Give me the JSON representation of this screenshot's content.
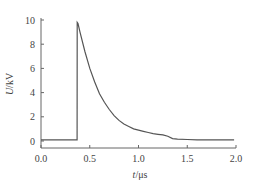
{
  "chart_data": {
    "type": "line",
    "title": "",
    "xlabel": "t/μs",
    "ylabel": "U/kV",
    "xlabel_italic_part": "t",
    "xlabel_unit": "/μs",
    "ylabel_italic_part": "U",
    "ylabel_unit": "/kV",
    "xlim": [
      0.0,
      2.0
    ],
    "ylim": [
      0,
      10
    ],
    "xticks": [
      "0.0",
      "0.5",
      "1.0",
      "1.5",
      "2.0"
    ],
    "yticks": [
      "0",
      "2",
      "4",
      "6",
      "8",
      "10"
    ],
    "grid": false,
    "legend": null,
    "line_color": "#555555",
    "series": [
      {
        "name": "voltage pulse",
        "x": [
          0.0,
          0.05,
          0.1,
          0.15,
          0.2,
          0.25,
          0.3,
          0.35,
          0.37,
          0.371,
          0.38,
          0.4,
          0.45,
          0.5,
          0.55,
          0.6,
          0.65,
          0.7,
          0.75,
          0.8,
          0.85,
          0.9,
          0.95,
          1.0,
          1.05,
          1.1,
          1.15,
          1.2,
          1.25,
          1.3,
          1.35,
          1.4,
          1.5,
          1.6,
          1.7,
          1.8,
          1.9,
          1.98
        ],
        "values": [
          0.1,
          0.1,
          0.1,
          0.1,
          0.1,
          0.1,
          0.1,
          0.1,
          0.1,
          9.8,
          9.7,
          9.0,
          7.4,
          6.0,
          4.9,
          3.9,
          3.2,
          2.6,
          2.1,
          1.7,
          1.4,
          1.2,
          1.0,
          0.9,
          0.8,
          0.7,
          0.6,
          0.55,
          0.5,
          0.4,
          0.2,
          0.15,
          0.12,
          0.1,
          0.1,
          0.1,
          0.1,
          0.1
        ]
      }
    ]
  }
}
